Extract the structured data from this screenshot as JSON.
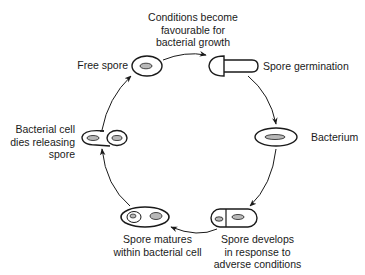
{
  "diagram": {
    "stages": [
      {
        "id": "favourable",
        "lines": [
          "Conditions become",
          "favourable for",
          "bacterial growth"
        ]
      },
      {
        "id": "free_spore",
        "lines": [
          "Free spore"
        ]
      },
      {
        "id": "germination",
        "lines": [
          "Spore germination"
        ]
      },
      {
        "id": "bacterium",
        "lines": [
          "Bacterium"
        ]
      },
      {
        "id": "spore_develops",
        "lines": [
          "Spore develops",
          "in response to",
          "adverse conditions"
        ]
      },
      {
        "id": "spore_matures",
        "lines": [
          "Spore matures",
          "within bacterial cell"
        ]
      },
      {
        "id": "cell_dies",
        "lines": [
          "Bacterial cell",
          "dies releasing",
          "spore"
        ]
      }
    ],
    "flow": [
      "free_spore",
      "germination",
      "bacterium",
      "spore_develops",
      "spore_matures",
      "cell_dies",
      "free_spore"
    ],
    "colors": {
      "ink": "#1a1a1a",
      "spore_fill": "#b8b8b8",
      "background": "#ffffff"
    }
  }
}
